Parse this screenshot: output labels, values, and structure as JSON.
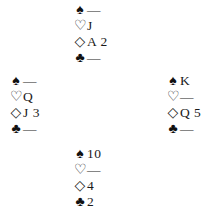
{
  "diagram": {
    "type": "bridge-deal",
    "hands": {
      "north": {
        "spades": "—",
        "hearts": "J",
        "diamonds": "A 2",
        "clubs": "—"
      },
      "west": {
        "spades": "—",
        "hearts": "Q",
        "diamonds": "J 3",
        "clubs": "—"
      },
      "east": {
        "spades": "K",
        "hearts": "—",
        "diamonds": "Q 5",
        "clubs": "—"
      },
      "south": {
        "spades": "10",
        "hearts": "—",
        "diamonds": "4",
        "clubs": "2"
      }
    },
    "suit_symbols": {
      "spades": "♠",
      "hearts": "♡",
      "diamonds": "◇",
      "clubs": "♣"
    }
  }
}
